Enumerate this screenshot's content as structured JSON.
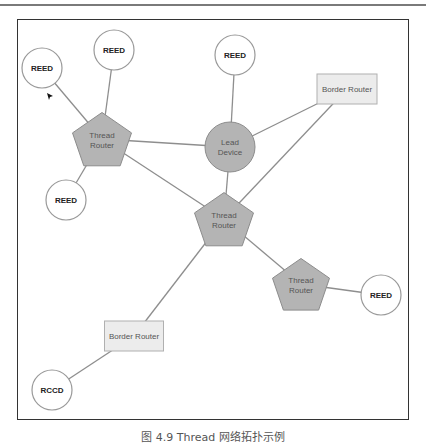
{
  "header": {
    "running_text": "────────────"
  },
  "diagram": {
    "nodes": [
      {
        "id": "reed1",
        "type": "reed",
        "label": "REED"
      },
      {
        "id": "reed2",
        "type": "reed",
        "label": "REED"
      },
      {
        "id": "router1",
        "type": "thread-router",
        "label": "Thread\nRouter",
        "line1": "Thread",
        "line2": "Router"
      },
      {
        "id": "reed3",
        "type": "reed",
        "label": "REED"
      },
      {
        "id": "reed4",
        "type": "reed",
        "label": "REED"
      },
      {
        "id": "leader",
        "type": "leader",
        "label": "Lead\nDevice",
        "line1": "Lead",
        "line2": "Device"
      },
      {
        "id": "br1",
        "type": "border-router",
        "label": "Border Router"
      },
      {
        "id": "router2",
        "type": "thread-router",
        "label": "Thread\nRouter",
        "line1": "Thread",
        "line2": "Router"
      },
      {
        "id": "router3",
        "type": "thread-router",
        "label": "Thread\nRouter",
        "line1": "Thread",
        "line2": "Router"
      },
      {
        "id": "reed5",
        "type": "reed",
        "label": "REED"
      },
      {
        "id": "br2",
        "type": "border-router",
        "label": "Border Router"
      },
      {
        "id": "reed6",
        "type": "reed",
        "label": "RCCD"
      }
    ],
    "edges": [
      [
        "reed1",
        "router1"
      ],
      [
        "reed2",
        "router1"
      ],
      [
        "reed3",
        "router1"
      ],
      [
        "router1",
        "leader"
      ],
      [
        "router1",
        "router2"
      ],
      [
        "reed4",
        "leader"
      ],
      [
        "leader",
        "br1"
      ],
      [
        "leader",
        "router2"
      ],
      [
        "router2",
        "br1"
      ],
      [
        "router2",
        "router3"
      ],
      [
        "router2",
        "br2"
      ],
      [
        "router3",
        "reed5"
      ],
      [
        "br2",
        "reed6"
      ]
    ],
    "colors": {
      "node_fill": "#b4b4b4",
      "node_stroke": "#8c8c8c",
      "reed_fill": "#ffffff",
      "reed_stroke": "#999999",
      "box_fill": "#ececec",
      "box_stroke": "#b0b0b0",
      "edge": "#8e8e8e"
    }
  },
  "caption": "图 4.9  Thread 网络拓扑示例"
}
